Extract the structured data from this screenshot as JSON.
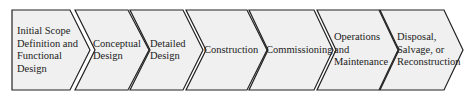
{
  "diagram": {
    "type": "process-chevron-flow",
    "fill": "#f0f0f0",
    "stroke": "#222222",
    "steps": [
      {
        "label": "Initial Scope Definition and Functional Design"
      },
      {
        "label": "Conceptual Design"
      },
      {
        "label": "Detailed Design"
      },
      {
        "label": "Construction"
      },
      {
        "label": "Commissioning"
      },
      {
        "label": "Operations and Maintenance"
      },
      {
        "label": "Disposal, Salvage, or Reconstruction"
      }
    ]
  }
}
